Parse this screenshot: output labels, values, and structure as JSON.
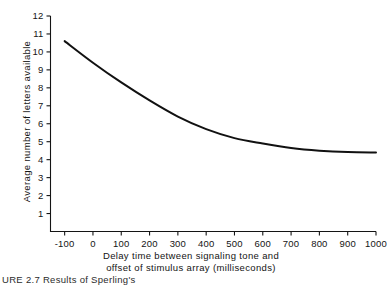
{
  "figure": {
    "caption_partial": "URE 2.7   Results of Sperling's"
  },
  "chart_data": {
    "type": "line",
    "title": "",
    "subtitle": "",
    "xlabel_line1": "Delay time between signaling tone and",
    "xlabel_line2": "offset of stimulus array (milliseconds)",
    "xlabel": "Delay time between signaling tone and offset of stimulus array (milliseconds)",
    "ylabel": "Average number of letters available",
    "xlim": [
      -150,
      1000
    ],
    "ylim": [
      0,
      12
    ],
    "xticks": [
      -100,
      0,
      100,
      200,
      300,
      400,
      500,
      600,
      700,
      800,
      900,
      1000
    ],
    "xticklabels": [
      "-100",
      "0",
      "100",
      "200",
      "300",
      "400",
      "500",
      "600",
      "700",
      "800",
      "900",
      "1000"
    ],
    "yticks": [
      1,
      2,
      3,
      4,
      5,
      6,
      7,
      8,
      9,
      10,
      11,
      12
    ],
    "yticklabels": [
      "1",
      "2",
      "3",
      "4",
      "5",
      "6",
      "7",
      "8",
      "9",
      "10",
      "11",
      "12"
    ],
    "grid": false,
    "legend": false,
    "legend_position": "none",
    "line_color": "#111111",
    "line_width": 2.0,
    "series": [
      {
        "name": "Letters available",
        "x": [
          -100,
          0,
          100,
          200,
          300,
          400,
          500,
          600,
          700,
          800,
          900,
          1000
        ],
        "values": [
          10.6,
          9.4,
          8.3,
          7.3,
          6.4,
          5.7,
          5.2,
          4.9,
          4.65,
          4.5,
          4.42,
          4.4
        ]
      }
    ],
    "annotations": []
  }
}
